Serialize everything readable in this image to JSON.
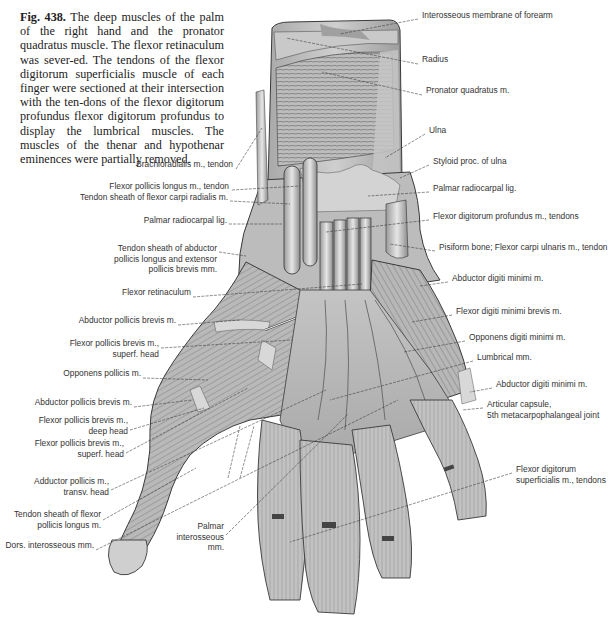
{
  "caption": {
    "figure_number": "Fig. 438.",
    "text": "The deep muscles of the palm of the right hand and the pronator quadratus muscle. The flexor retinaculum was sever-ed. The tendons of the flexor digitorum superficialis muscle of each finger were sectioned at their intersection with the ten-dons of the flexor digitorum profundus flexor digitorum profundus to display the lumbrical muscles. The muscles of the thenar and hypothenar eminences were partially removed."
  },
  "labels_left": [
    {
      "text": "Brachioradialis m., tendon",
      "x": 233,
      "y": 164
    },
    {
      "text": "Flexor pollicis longus m., tendon",
      "x": 229,
      "y": 186
    },
    {
      "text": "Tendon sheath of flexor carpi radialis m.",
      "x": 228,
      "y": 197
    },
    {
      "text": "Palmar radiocarpal lig.",
      "x": 227,
      "y": 220
    },
    {
      "text": "Tendon sheath of abductor\npollicis longus and extensor\npollicis brevis mm.",
      "x": 217,
      "y": 248
    },
    {
      "text": "Flexor retinaculum",
      "x": 191,
      "y": 292
    },
    {
      "text": "Abductor pollicis brevis m.",
      "x": 176,
      "y": 320
    },
    {
      "text": "Flexor pollicis brevis m.,\nsuperf. head",
      "x": 159,
      "y": 343
    },
    {
      "text": "Opponens pollicis m.",
      "x": 141,
      "y": 373
    },
    {
      "text": "Abductor pollicis brevis m.",
      "x": 132,
      "y": 402
    },
    {
      "text": "Flexor pollicis brevis m.,\ndeep head",
      "x": 128,
      "y": 420
    },
    {
      "text": "Flexor pollicis brevis m.,\nsuperf. head",
      "x": 124,
      "y": 443
    },
    {
      "text": "Adductor pollicis m.,\ntransv. head",
      "x": 109,
      "y": 481
    },
    {
      "text": "Tendon sheath of flexor\npollicis longus m.",
      "x": 101,
      "y": 514
    },
    {
      "text": "Dors. interosseous mm.",
      "x": 94,
      "y": 545
    },
    {
      "text": "Palmar\ninterosseous\nmm.",
      "x": 224,
      "y": 526
    }
  ],
  "labels_right": [
    {
      "text": "Interosseous membrane of forearm",
      "x": 422,
      "y": 15
    },
    {
      "text": "Radius",
      "x": 422,
      "y": 59
    },
    {
      "text": "Pronator quadratus m.",
      "x": 426,
      "y": 90
    },
    {
      "text": "Ulna",
      "x": 429,
      "y": 130
    },
    {
      "text": "Styloid proc. of ulna",
      "x": 433,
      "y": 161
    },
    {
      "text": "Palmar radiocarpal lig.",
      "x": 433,
      "y": 188
    },
    {
      "text": "Flexor digitorum profundus m., tendons",
      "x": 433,
      "y": 216
    },
    {
      "text": "Pisiform bone; Flexor carpi ulnaris m., tendon",
      "x": 439,
      "y": 247
    },
    {
      "text": "Abductor digiti minimi m.",
      "x": 452,
      "y": 278
    },
    {
      "text": "Flexor digiti minimi brevis m.",
      "x": 456,
      "y": 311
    },
    {
      "text": "Opponens digiti minimi m.",
      "x": 469,
      "y": 337
    },
    {
      "text": "Lumbrical mm.",
      "x": 477,
      "y": 357
    },
    {
      "text": "Abductor digiti minimi m.",
      "x": 496,
      "y": 384
    },
    {
      "text": "Articular capsule,\n5th metacarpophalangeal joint",
      "x": 487,
      "y": 404
    },
    {
      "text": "Flexor digitorum\nsuperficialis m., tendons",
      "x": 516,
      "y": 469
    }
  ],
  "colors": {
    "background": "#ffffff",
    "text": "#222222",
    "label": "#333333",
    "leader": "#333333",
    "tissue_light": "#d9d9d9",
    "tissue_mid": "#b5b5b5",
    "tissue_dark": "#7a7a7a",
    "outline": "#3a3a3a"
  }
}
